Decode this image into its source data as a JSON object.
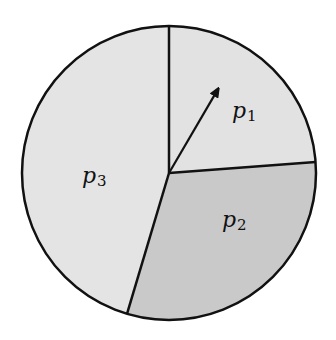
{
  "diagram": {
    "type": "pie-diagram",
    "center": [
      169,
      173
    ],
    "radius": 147,
    "outline_color": "#111111",
    "arrow": {
      "from": [
        169,
        173
      ],
      "to": [
        221,
        84
      ],
      "color": "#111111"
    },
    "slices": [
      {
        "name": "p1",
        "label_base": "p",
        "label_sub": "1",
        "start_deg": -90,
        "end_deg": -4.3,
        "fill": "#e2e2e2",
        "label_pos": [
          232,
          118
        ]
      },
      {
        "name": "p2",
        "label_base": "p",
        "label_sub": "2",
        "start_deg": -4.3,
        "end_deg": 106.6,
        "fill": "#c9c9c9",
        "label_pos": [
          222,
          227
        ]
      },
      {
        "name": "p3",
        "label_base": "p",
        "label_sub": "3",
        "start_deg": 106.6,
        "end_deg": 270,
        "fill": "#e4e4e4",
        "label_pos": [
          82,
          183
        ]
      }
    ]
  },
  "chart_data": {
    "type": "pie",
    "title": "",
    "categories": [
      "p1",
      "p2",
      "p3"
    ],
    "values": [
      23.8,
      30.8,
      45.4
    ],
    "units": "percent (estimated from slice angles)"
  }
}
